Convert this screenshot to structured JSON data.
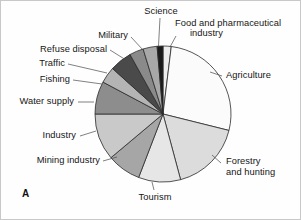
{
  "figure": {
    "panel_label": "A",
    "background": "#fefefe",
    "border_color": "#c8c8c8"
  },
  "chart_data": {
    "type": "pie",
    "title": "",
    "subtitle": "",
    "xlabel": "",
    "ylabel": "",
    "legend_position": "none",
    "grid": false,
    "labels_position": "outside-with-leader-lines",
    "start_angle_deg": 0,
    "direction": "clockwise",
    "center_px": [
      163,
      114
    ],
    "radius_px": 68,
    "units": "percent",
    "categories": [
      "Food and pharmaceutical industry",
      "Agriculture",
      "Forestry and hunting",
      "Tourism",
      "Mining industry",
      "Industry",
      "Water supply",
      "Fishing",
      "Traffic",
      "Refuse disposal",
      "Military",
      "Science"
    ],
    "values": [
      2,
      27,
      17,
      10,
      8,
      9,
      9,
      4,
      6,
      4,
      3,
      1
    ],
    "colors": [
      "#ededed",
      "#fbfbfb",
      "#dcdcdc",
      "#e6e6e6",
      "#a6a6a6",
      "#c9c9c9",
      "#8d8d8d",
      "#b4b4b4",
      "#4a4a4a",
      "#8a8a8a",
      "#a8a8a8",
      "#1a1a1a"
    ],
    "slices": [
      {
        "label": "Food and pharmaceutical industry",
        "value": 2,
        "color": "#ededed",
        "start_deg": 0,
        "end_deg": 7
      },
      {
        "label": "Agriculture",
        "value": 27,
        "color": "#fbfbfb",
        "start_deg": 7,
        "end_deg": 104
      },
      {
        "label": "Forestry and hunting",
        "value": 17,
        "color": "#dcdcdc",
        "start_deg": 104,
        "end_deg": 165
      },
      {
        "label": "Tourism",
        "value": 10,
        "color": "#e6e6e6",
        "start_deg": 165,
        "end_deg": 201
      },
      {
        "label": "Mining industry",
        "value": 8,
        "color": "#a6a6a6",
        "start_deg": 201,
        "end_deg": 230
      },
      {
        "label": "Industry",
        "value": 9,
        "color": "#c9c9c9",
        "start_deg": 230,
        "end_deg": 270
      },
      {
        "label": "Water supply",
        "value": 9,
        "color": "#8d8d8d",
        "start_deg": 270,
        "end_deg": 298
      },
      {
        "label": "Fishing",
        "value": 4,
        "color": "#b4b4b4",
        "start_deg": 298,
        "end_deg": 312
      },
      {
        "label": "Traffic",
        "value": 6,
        "color": "#4a4a4a",
        "start_deg": 312,
        "end_deg": 331
      },
      {
        "label": "Refuse disposal",
        "value": 4,
        "color": "#8a8a8a",
        "start_deg": 331,
        "end_deg": 343
      },
      {
        "label": "Military",
        "value": 3,
        "color": "#a8a8a8",
        "start_deg": 343,
        "end_deg": 355
      },
      {
        "label": "Science",
        "value": 1,
        "color": "#1a1a1a",
        "start_deg": 355,
        "end_deg": 360
      }
    ]
  },
  "labels": {
    "science": "Science",
    "food_pharma_line1": "Food and pharmaceutical",
    "food_pharma_line2": "industry",
    "agriculture": "Agriculture",
    "forestry_line1": "Forestry",
    "forestry_line2": "and hunting",
    "tourism": "Tourism",
    "mining_industry": "Mining industry",
    "industry": "Industry",
    "water_supply": "Water supply",
    "fishing": "Fishing",
    "traffic": "Traffic",
    "refuse_disposal": "Refuse disposal",
    "military": "Military"
  }
}
